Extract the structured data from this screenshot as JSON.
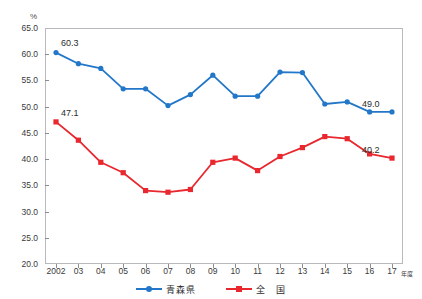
{
  "top_title": "",
  "axis": {
    "unit": "%",
    "x_unit": "年度",
    "y_ticks": [
      "65.0",
      "60.0",
      "55.0",
      "50.0",
      "45.0",
      "40.0",
      "35.0",
      "30.0",
      "25.0",
      "20.0"
    ],
    "x_ticks": [
      "2002",
      "03",
      "04",
      "05",
      "06",
      "07",
      "08",
      "09",
      "10",
      "11",
      "12",
      "13",
      "14",
      "15",
      "16",
      "17"
    ]
  },
  "legend": {
    "items": [
      {
        "label": "青森県",
        "color": "#2277c8",
        "marker": "circle"
      },
      {
        "label": "全　国",
        "color": "#e8272f",
        "marker": "square"
      }
    ]
  },
  "annotations": [
    {
      "text": "60.3",
      "series": "青森県",
      "at": "2002"
    },
    {
      "text": "49.0",
      "series": "青森県",
      "at": "17"
    },
    {
      "text": "47.1",
      "series": "全国",
      "at": "2002"
    },
    {
      "text": "40.2",
      "series": "全国",
      "at": "17"
    }
  ],
  "chart_data": {
    "type": "line",
    "title": "",
    "xlabel": "年度",
    "ylabel": "%",
    "ylim": [
      20.0,
      65.0
    ],
    "ytick_step": 5.0,
    "grid": false,
    "legend_position": "bottom-center",
    "categories": [
      "2002",
      "03",
      "04",
      "05",
      "06",
      "07",
      "08",
      "09",
      "10",
      "11",
      "12",
      "13",
      "14",
      "15",
      "16",
      "17"
    ],
    "series": [
      {
        "name": "青森県",
        "color": "#2277c8",
        "marker": "circle",
        "values": [
          60.3,
          58.2,
          57.3,
          53.4,
          53.4,
          50.2,
          52.3,
          56.0,
          52.0,
          52.0,
          56.6,
          56.5,
          50.5,
          50.9,
          49.0,
          49.0
        ],
        "labeled_points": {
          "2002": "60.3",
          "17": "49.0"
        }
      },
      {
        "name": "全　国",
        "color": "#e8272f",
        "marker": "square",
        "values": [
          47.1,
          43.6,
          39.4,
          37.4,
          34.0,
          33.7,
          34.2,
          39.4,
          40.2,
          37.8,
          40.5,
          42.2,
          44.3,
          43.9,
          41.0,
          40.2
        ],
        "labeled_points": {
          "2002": "47.1",
          "17": "40.2"
        }
      }
    ]
  }
}
